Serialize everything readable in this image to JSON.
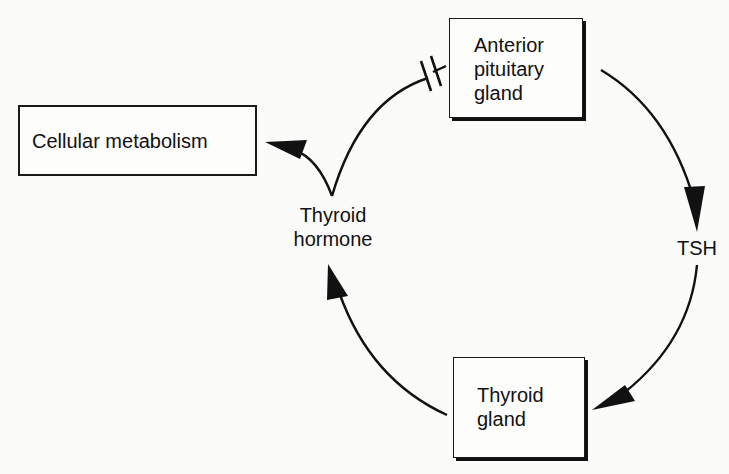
{
  "diagram": {
    "type": "feedback-loop",
    "nodes": {
      "anterior_pituitary": {
        "label": "Anterior\npituitary\ngland"
      },
      "cellular_metabolism": {
        "label": "Cellular metabolism"
      },
      "thyroid_gland": {
        "label": "Thyroid\ngland"
      }
    },
    "intermediates": {
      "thyroid_hormone": {
        "label": "Thyroid\nhormone"
      },
      "tsh": {
        "label": "TSH"
      }
    },
    "edges": [
      {
        "from": "anterior_pituitary",
        "to": "tsh",
        "style": "arrow"
      },
      {
        "from": "tsh",
        "to": "thyroid_gland",
        "style": "arrow"
      },
      {
        "from": "thyroid_gland",
        "to": "thyroid_hormone",
        "style": "arrow"
      },
      {
        "from": "thyroid_hormone",
        "to": "cellular_metabolism",
        "style": "arrow"
      },
      {
        "from": "thyroid_hormone",
        "to": "anterior_pituitary",
        "style": "inhibition (blocked, double bar)"
      }
    ],
    "colors": {
      "ink": "#111111",
      "background": "#fbfbf9"
    }
  }
}
